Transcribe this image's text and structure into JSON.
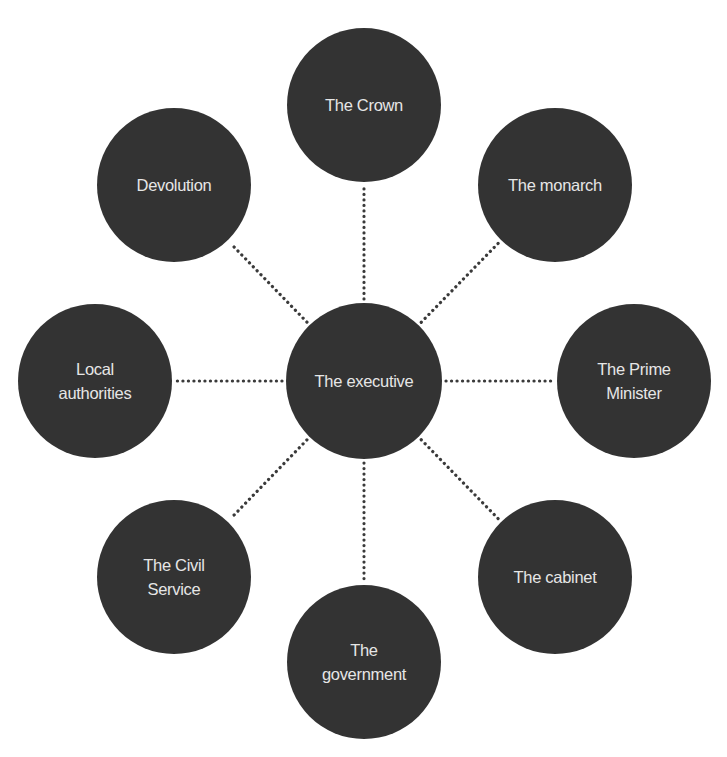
{
  "diagram": {
    "title": "The executive",
    "colors": {
      "node_fill": "#333333",
      "node_text": "#e6e6e6",
      "connector": "#3a3a3a",
      "background": "#ffffff"
    },
    "center": {
      "id": "executive",
      "label_lines": [
        "The executive"
      ]
    },
    "nodes": [
      {
        "id": "crown",
        "label_lines": [
          "The Crown"
        ],
        "direction": "top"
      },
      {
        "id": "monarch",
        "label_lines": [
          "The monarch"
        ],
        "direction": "top-right"
      },
      {
        "id": "prime-minister",
        "label_lines": [
          "The Prime",
          "Minister"
        ],
        "direction": "right"
      },
      {
        "id": "cabinet",
        "label_lines": [
          "The cabinet"
        ],
        "direction": "bottom-right"
      },
      {
        "id": "government",
        "label_lines": [
          "The",
          "government"
        ],
        "direction": "bottom"
      },
      {
        "id": "civil-service",
        "label_lines": [
          "The Civil",
          "Service"
        ],
        "direction": "bottom-left"
      },
      {
        "id": "local-authorities",
        "label_lines": [
          "Local",
          "authorities"
        ],
        "direction": "left"
      },
      {
        "id": "devolution",
        "label_lines": [
          "Devolution"
        ],
        "direction": "top-left"
      }
    ],
    "connector_style": "dotted"
  }
}
